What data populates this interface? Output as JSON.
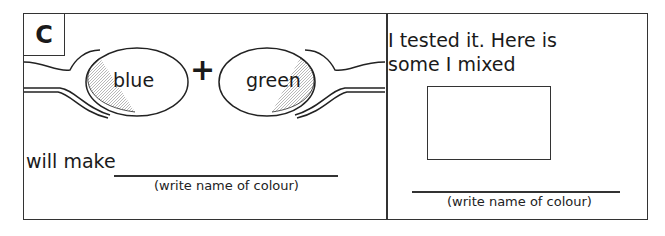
{
  "activity": {
    "label": "C",
    "spoons": [
      {
        "colour": "blue"
      },
      {
        "colour": "green"
      }
    ],
    "operator": "+",
    "result_prompt": "will make",
    "result_hint": "(write name of colour)"
  },
  "test_panel": {
    "line1": "I tested it. Here is",
    "line2": "some I mixed",
    "swatch_value": "",
    "result_hint": "(write name of colour)"
  }
}
